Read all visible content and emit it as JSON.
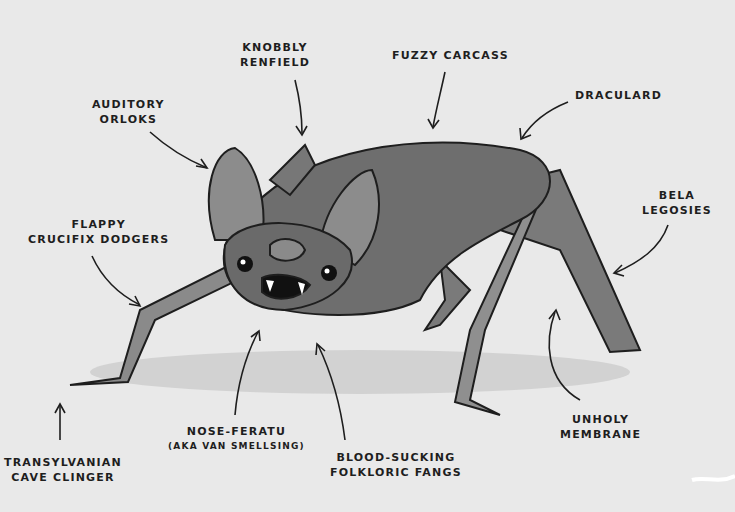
{
  "diagram": {
    "colors": {
      "background": "#e9e9e9",
      "ink": "#1e1e1e",
      "fur": "#6e6e6e",
      "shadow": "#bdbdbd"
    },
    "labels": [
      {
        "id": "knobbly-renfield",
        "lines": [
          "Knobbly",
          "Renfield"
        ]
      },
      {
        "id": "fuzzy-carcass",
        "lines": [
          "Fuzzy Carcass"
        ]
      },
      {
        "id": "draculard",
        "lines": [
          "Draculard"
        ]
      },
      {
        "id": "auditory-orloks",
        "lines": [
          "Auditory",
          "Orloks"
        ]
      },
      {
        "id": "flappy-crucifix-dodgers",
        "lines": [
          "Flappy",
          "Crucifix Dodgers"
        ]
      },
      {
        "id": "bela-legosies",
        "lines": [
          "Bela",
          "Legosies"
        ]
      },
      {
        "id": "transylvanian-cave-clinger",
        "lines": [
          "Transylvanian",
          "Cave Clinger"
        ]
      },
      {
        "id": "nose-feratu",
        "lines": [
          "Nose-Feratu",
          "(aka Van Smellsing)"
        ]
      },
      {
        "id": "blood-sucking-folkloric-fangs",
        "lines": [
          "Blood-Sucking",
          "Folkloric Fangs"
        ]
      },
      {
        "id": "unholy-membrane",
        "lines": [
          "Unholy",
          "Membrane"
        ]
      }
    ]
  }
}
